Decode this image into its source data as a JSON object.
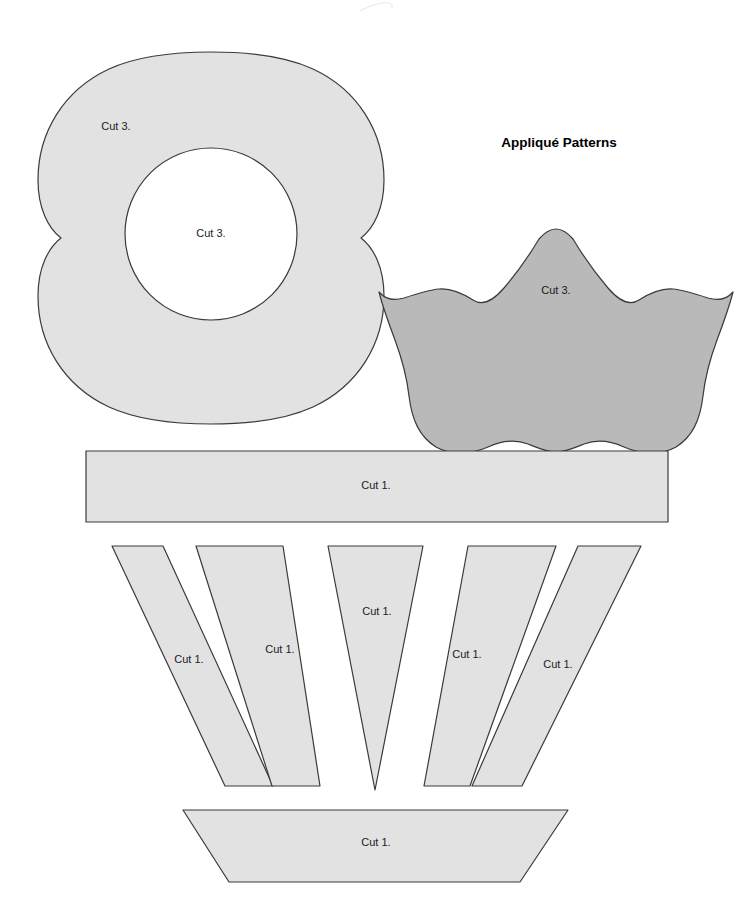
{
  "sheet": {
    "title": "Appliqué Patterns",
    "title_pos": {
      "x": 559,
      "y": 143
    },
    "background_color": "#ffffff",
    "outline_color": "#3a3a3a",
    "fill_light": "#e2e2e2",
    "fill_medium": "#b9b9b9",
    "fill_white": "#ffffff",
    "label_color": "#1b1b1b"
  },
  "pieces": [
    {
      "id": "flower-four-petal",
      "name": "four-petal-flower",
      "label": "Cut 3.",
      "label_pos": {
        "x": 116,
        "y": 127
      },
      "fill": "#e2e2e2",
      "path": "M 211 52 C 170 52 133 58 109 69 C 64 90 38 132 38 180 C 38 208 48 228 61 238 C 48 248 38 268 38 296 C 38 344 64 386 109 407 C 133 418 170 424 211 424 C 252 424 289 418 313 407 C 358 386 384 344 384 296 C 384 268 374 248 361 238 C 374 228 384 208 384 180 C 384 132 358 90 313 69 C 289 58 252 52 211 52 Z"
    },
    {
      "id": "flower-center-circle",
      "name": "flower-center-circle",
      "label": "Cut 3.",
      "label_pos": {
        "x": 211,
        "y": 234
      },
      "fill": "#ffffff",
      "circle": {
        "cx": 211,
        "cy": 234,
        "r": 86
      }
    },
    {
      "id": "tulip",
      "name": "tulip-petal",
      "label": "Cut 3.",
      "label_pos": {
        "x": 556,
        "y": 291
      },
      "fill": "#b9b9b9",
      "path": "M 557 177 C 566 192 580 212 592 226 C 604 240 614 244 623 238 C 634 231 646 226 657 227 C 668 228 680 232 692 236 C 702 239 711 237 717 230 C 713 246 707 262 701 278 C 694 297 689 316 687 334 C 684 359 676 375 660 385 C 644 394 624 392 608 385 C 595 379 581 377 568 382 C 558 386 549 390 540 390 C 531 390 522 386 512 382 C 499 377 485 379 472 385 C 456 392 436 394 420 385 C 404 375 396 359 393 334 C 391 316 386 297 379 278 C 373 262 367 246 363 230 C 369 237 378 239 388 236 C 400 232 412 228 423 227 C 434 226 446 231 457 238 C 466 244 476 240 488 226 C 500 212 514 192 523 177 C 529 170 534 167 540 167 C 546 167 551 170 557 177 Z",
      "path_note": "rendered with a translated coordinate system"
    },
    {
      "id": "basket-band",
      "name": "basket-rim-band",
      "label": "Cut 1.",
      "label_pos": {
        "x": 376,
        "y": 486
      },
      "fill": "#e2e2e2",
      "rect": {
        "x": 86,
        "y": 451,
        "w": 582,
        "h": 71
      }
    },
    {
      "id": "slat-1",
      "name": "basket-slat-1",
      "label": "Cut 1.",
      "label_pos": {
        "x": 189,
        "y": 660
      },
      "fill": "#e2e2e2",
      "path": "M 112 546 L 163 546 L 273 786 L 225 786 Z"
    },
    {
      "id": "slat-2",
      "name": "basket-slat-2",
      "label": "Cut 1.",
      "label_pos": {
        "x": 280,
        "y": 650
      },
      "fill": "#e2e2e2",
      "path": "M 196 546 L 283 546 L 320 786 L 272 786 Z"
    },
    {
      "id": "slat-3",
      "name": "basket-slat-3-center",
      "label": "Cut 1.",
      "label_pos": {
        "x": 377,
        "y": 612
      },
      "fill": "#e2e2e2",
      "path": "M 328 546 L 423 546 L 375 790 Z"
    },
    {
      "id": "slat-4",
      "name": "basket-slat-4",
      "label": "Cut 1.",
      "label_pos": {
        "x": 467,
        "y": 655
      },
      "fill": "#e2e2e2",
      "path": "M 468 546 L 556 546 L 470 786 L 424 786 Z"
    },
    {
      "id": "slat-5",
      "name": "basket-slat-5",
      "label": "Cut 1.",
      "label_pos": {
        "x": 558,
        "y": 665
      },
      "fill": "#e2e2e2",
      "path": "M 578 546 L 641 546 L 522 786 L 472 786 Z"
    },
    {
      "id": "basket-base",
      "name": "basket-base-trapezoid",
      "label": "Cut 1.",
      "label_pos": {
        "x": 376,
        "y": 843
      },
      "fill": "#e2e2e2",
      "path": "M 183 810 L 568 810 L 520 882 L 229 882 Z"
    }
  ],
  "decoration": {
    "faint_mark_name": "faint-scan-artifact",
    "faint_mark_path": "M 360 11 C 367 7 375 4 383 3 C 389 2 393 4 392 8"
  }
}
